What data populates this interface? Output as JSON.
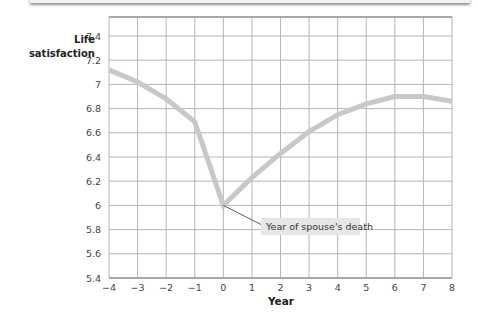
{
  "chart_data": {
    "type": "line",
    "title": "",
    "xlabel": "Year",
    "ylabel": "Life satisfaction",
    "ylabel_lines": [
      "Life",
      "satisfaction"
    ],
    "x": [
      -4,
      -3,
      -2,
      -1,
      0,
      1,
      2,
      3,
      4,
      5,
      6,
      7,
      8
    ],
    "series": [
      {
        "name": "Life satisfaction",
        "values": [
          7.12,
          7.02,
          6.88,
          6.69,
          6.0,
          6.23,
          6.43,
          6.61,
          6.75,
          6.84,
          6.9,
          6.9,
          6.86
        ]
      }
    ],
    "xlim": [
      -4,
      8
    ],
    "ylim": [
      5.4,
      7.4
    ],
    "x_ticks": [
      "−4",
      "−3",
      "−2",
      "−1",
      "0",
      "1",
      "2",
      "3",
      "4",
      "5",
      "6",
      "7",
      "8"
    ],
    "y_ticks": [
      "5.4",
      "5.6",
      "5.8",
      "6",
      "6.2",
      "6.4",
      "6.6",
      "6.8",
      "7",
      "7.2",
      "7.4"
    ],
    "grid": true,
    "legend": null,
    "annotations": [
      {
        "text": "Year of spouse's death",
        "x": 0,
        "y": 6.0
      }
    ],
    "colors": {
      "line": "#c8c8c8",
      "grid": "#b5b5b5",
      "label_box": "#e6e6e6"
    }
  }
}
